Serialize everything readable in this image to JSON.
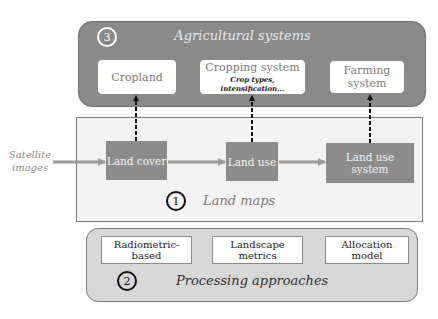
{
  "diagram": {
    "input": {
      "label_line1": "Satellite",
      "label_line2": "images"
    },
    "agricultural_systems": {
      "number": "3",
      "title": "Agricultural systems",
      "boxes": [
        {
          "label": "Cropland"
        },
        {
          "label": "Cropping system",
          "sublabel": "Crop types, intensification..."
        },
        {
          "label": "Farming system"
        }
      ]
    },
    "land_maps": {
      "number": "1",
      "title": "Land maps",
      "boxes": [
        {
          "label": "Land cover"
        },
        {
          "label": "Land use"
        },
        {
          "label": "Land use system"
        }
      ]
    },
    "processing_approaches": {
      "number": "2",
      "title": "Processing approaches",
      "boxes": [
        {
          "label": "Radiometric-based"
        },
        {
          "label": "Landscape metrics"
        },
        {
          "label": "Allocation model"
        }
      ]
    },
    "colors": {
      "top_panel": "#8a8a8a",
      "gray_box": "#8c8c8c",
      "maps_panel": "#f3f3f3",
      "proc_panel": "#d8d8d8",
      "arrow": "#9a9a9a"
    }
  }
}
